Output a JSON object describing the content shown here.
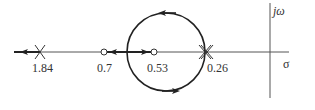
{
  "diagram": {
    "type": "root-locus",
    "axes": {
      "real_label": "σ",
      "imag_label": "jω"
    },
    "poles": [
      {
        "label": "1.84",
        "multiplicity": 1
      },
      {
        "label": "0.26",
        "multiplicity": 2
      }
    ],
    "zeros": [
      {
        "label": "0.7"
      },
      {
        "label": "0.53"
      }
    ],
    "colors": {
      "axis": "#555555",
      "locus": "#222222",
      "text": "#333333"
    }
  }
}
